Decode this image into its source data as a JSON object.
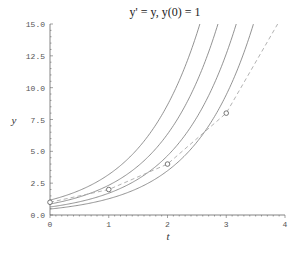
{
  "chart_data": {
    "type": "line",
    "title": "y' = y,    y(0) = 1",
    "xlabel": "t",
    "ylabel": "y",
    "xlim": [
      0,
      4
    ],
    "ylim": [
      0,
      15
    ],
    "x_ticks": [
      "0",
      "1",
      "2",
      "3",
      "4"
    ],
    "y_ticks": [
      "0.0",
      "2.5",
      "5.0",
      "7.5",
      "10.0",
      "12.5",
      "15.0"
    ],
    "grid": false,
    "series": [
      {
        "name": "solution curve C=1.17",
        "style": "solid",
        "formula": "1.17*e^t"
      },
      {
        "name": "solution curve C=0.86",
        "style": "solid",
        "formula": "0.86*e^t"
      },
      {
        "name": "solution curve C=0.63",
        "style": "solid",
        "formula": "0.63*e^t"
      },
      {
        "name": "solution curve C=0.47",
        "style": "solid",
        "formula": "0.47*e^t"
      },
      {
        "name": "Euler approximation",
        "style": "dashed",
        "x": [
          0,
          1,
          2,
          3,
          4
        ],
        "values": [
          1,
          2,
          4,
          8,
          16
        ]
      }
    ],
    "markers": {
      "x": [
        0,
        1,
        2,
        3
      ],
      "values": [
        1,
        2,
        4,
        8
      ],
      "shape": "open-circle"
    }
  },
  "colors": {
    "curve": "#777777",
    "euler": "#aaaaaa",
    "axis": "#666666"
  }
}
